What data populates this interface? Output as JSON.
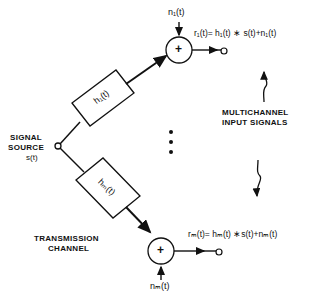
{
  "diagram": {
    "source": {
      "label_line1": "SIGNAL",
      "label_line2": "SOURCE",
      "signal": "s(t)"
    },
    "channels": [
      {
        "filter": "h₁(t)",
        "noise": "n₁(t)",
        "adder": "+",
        "output_eq": "r₁(t)= h₁(t) ∗ s(t)+n₁(t)"
      },
      {
        "filter": "hₘ(t)",
        "noise": "nₘ(t)",
        "adder": "+",
        "output_eq": "rₘ(t)= hₘ(t) ∗s(t)+nₘ(t)"
      }
    ],
    "ellipsis": "⋮",
    "labels": {
      "multichannel_line1": "MULTICHANNEL",
      "multichannel_line2": "INPUT SIGNALS",
      "transmission_line1": "TRANSMISSION",
      "transmission_line2": "CHANNEL"
    },
    "colors": {
      "ink": "#111111",
      "background": "#ffffff"
    }
  }
}
